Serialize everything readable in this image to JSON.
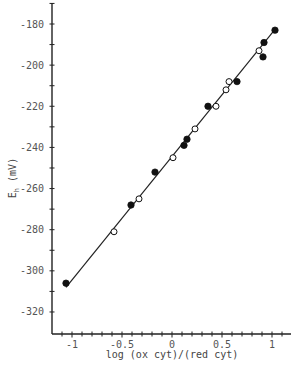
{
  "chart_data": {
    "type": "scatter",
    "title": "",
    "xlabel": "log (ox cyt)/(red cyt)",
    "ylabel": "E_h (mV)",
    "ylabel_main": "E",
    "ylabel_sub": "h",
    "ylabel_unit": "(mV)",
    "xlim": [
      -1.2,
      1.18
    ],
    "ylim": [
      -330,
      -170
    ],
    "x_ticks": [
      -1,
      -0.5,
      0,
      0.5,
      1
    ],
    "x_tick_labels": [
      "-1",
      "-0.5",
      "0",
      "0.5",
      "1"
    ],
    "x_minor_step": 0.1,
    "y_ticks": [
      -180,
      -200,
      -220,
      -240,
      -260,
      -280,
      -300,
      -320
    ],
    "y_tick_labels": [
      "-180",
      "-200",
      "-220",
      "-240",
      "-260",
      "-280",
      "-300",
      "-320"
    ],
    "y_minor_step": 10,
    "grid": false,
    "legend": null,
    "series": [
      {
        "name": "filled circles",
        "marker": "filled-circle",
        "points": [
          {
            "x": -1.06,
            "y": -306
          },
          {
            "x": -0.41,
            "y": -268
          },
          {
            "x": -0.17,
            "y": -252
          },
          {
            "x": 0.12,
            "y": -239
          },
          {
            "x": 0.15,
            "y": -236
          },
          {
            "x": 0.36,
            "y": -220
          },
          {
            "x": 0.65,
            "y": -208
          },
          {
            "x": 0.91,
            "y": -196
          },
          {
            "x": 0.92,
            "y": -189
          },
          {
            "x": 1.03,
            "y": -183
          }
        ]
      },
      {
        "name": "open circles",
        "marker": "open-circle",
        "points": [
          {
            "x": -0.58,
            "y": -281
          },
          {
            "x": -0.33,
            "y": -265
          },
          {
            "x": 0.01,
            "y": -245
          },
          {
            "x": 0.23,
            "y": -231
          },
          {
            "x": 0.44,
            "y": -220
          },
          {
            "x": 0.54,
            "y": -212
          },
          {
            "x": 0.57,
            "y": -208
          },
          {
            "x": 0.87,
            "y": -193
          }
        ]
      }
    ],
    "fit_line": {
      "name": "linear fit",
      "x": [
        -1.06,
        1.04
      ],
      "y": [
        -308,
        -182
      ]
    }
  }
}
